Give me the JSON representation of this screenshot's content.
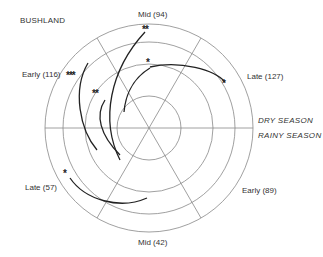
{
  "title": "BUSHLAND",
  "seasons": {
    "dry": "DRY SEASON",
    "rainy": "RAINY SEASON"
  },
  "sectors": [
    {
      "label": "Mid (94)",
      "season": "dry"
    },
    {
      "label": "Late (127)",
      "season": "dry"
    },
    {
      "label": "Early (116)",
      "season": "dry"
    },
    {
      "label": "Late (57)",
      "season": "rainy"
    },
    {
      "label": "Mid (42)",
      "season": "rainy"
    },
    {
      "label": "Early (89)",
      "season": "rainy"
    }
  ],
  "significance_markers": [
    {
      "text": "**",
      "position": "top"
    },
    {
      "text": "*",
      "position": "upper-center"
    },
    {
      "text": "*",
      "position": "upper-right"
    },
    {
      "text": "***",
      "position": "upper-left"
    },
    {
      "text": "**",
      "position": "left-center"
    },
    {
      "text": "*",
      "position": "lower-left"
    }
  ],
  "colors": {
    "line": "#777777",
    "curve": "#222222"
  }
}
